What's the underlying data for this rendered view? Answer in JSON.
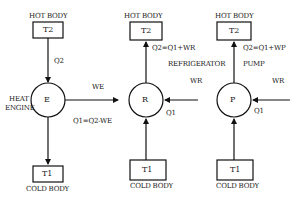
{
  "diagram": {
    "colors": {
      "line": "#111111",
      "text": "#1a1a1a",
      "background": "#ffffff"
    },
    "engine": {
      "hot_label": "HOT BODY",
      "hot_box": "T2",
      "q_in": "Q2",
      "node": "E",
      "name_line1": "HEAT",
      "name_line2": "ENGINE",
      "work": "WE",
      "q_out": "Q1=Q2-WE",
      "cold_box": "T1",
      "cold_label": "COLD BODY"
    },
    "refrigerator": {
      "hot_label": "HOT BODY",
      "hot_box": "T2",
      "q_out": "Q2=Q1+WR",
      "name": "REFRIGERATOR",
      "work": "WR",
      "node": "R",
      "q_in": "Q1",
      "cold_box": "T1",
      "cold_label": "COLD BODY"
    },
    "pump": {
      "hot_label": "HOT BODY",
      "hot_box": "T2",
      "q_out": "Q2=Q1+WP",
      "name": "PUMP",
      "work": "WR",
      "node": "P",
      "q_in": "Q1",
      "cold_box": "T1",
      "cold_label": "COLD BODY"
    }
  }
}
